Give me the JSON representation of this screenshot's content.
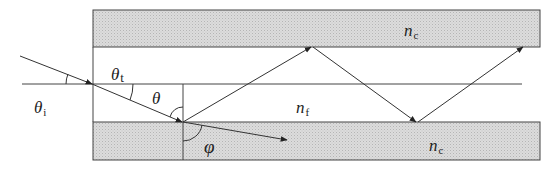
{
  "diagram": {
    "type": "slab-waveguide-ray-diagram",
    "colors": {
      "line": "#333333",
      "cladding_fill": "#d3d3d3",
      "background": "#ffffff"
    },
    "labels": {
      "theta_i": {
        "symbol": "θ",
        "sub": "i"
      },
      "theta_t": {
        "symbol": "θ",
        "sub": "t"
      },
      "theta": {
        "symbol": "θ"
      },
      "phi": {
        "symbol": "φ"
      },
      "n_c_top": {
        "symbol": "n",
        "sub": "c"
      },
      "n_f": {
        "symbol": "n",
        "sub": "f"
      },
      "n_c_bottom": {
        "symbol": "n",
        "sub": "c"
      }
    },
    "regions": [
      "top cladding (n_c)",
      "core film (n_f)",
      "bottom cladding (n_c)"
    ]
  }
}
